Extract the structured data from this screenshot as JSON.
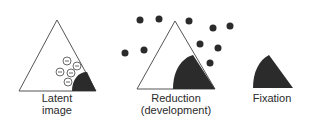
{
  "diagram": {
    "colors": {
      "outline": "#555555",
      "fill_dark": "#2b2b2b",
      "dot": "#2b2b2b",
      "background": "#ffffff"
    },
    "stages": [
      {
        "id": "latent-image",
        "label_line1": "Latent",
        "label_line2": "image",
        "electron_symbol": "−",
        "electron_count": 5
      },
      {
        "id": "reduction",
        "label_line1": "Reduction",
        "label_line2": "(development)",
        "dot_count": 10
      },
      {
        "id": "fixation",
        "label_line1": "Fixation"
      }
    ]
  }
}
